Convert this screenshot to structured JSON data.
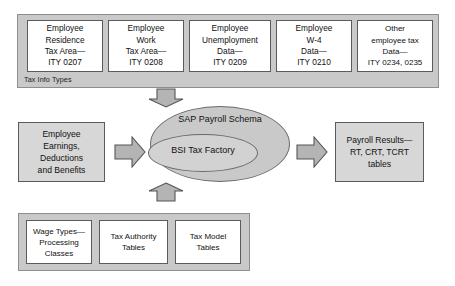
{
  "top_band": {
    "label": "Tax Info Types",
    "boxes": [
      {
        "name": "employee-residence-tax-area",
        "line1": "Employee",
        "line2": "Residence",
        "line3": "Tax Area—",
        "line4": "ITY 0207"
      },
      {
        "name": "employee-work-tax-area",
        "line1": "Employee",
        "line2": "Work",
        "line3": "Tax Area—",
        "line4": "ITY 0208"
      },
      {
        "name": "employee-unemployment-data",
        "line1": "Employee",
        "line2": "Unemployment",
        "line3": "Data—",
        "line4": "ITY 0209"
      },
      {
        "name": "employee-w4-data",
        "line1": "Employee",
        "line2": "W-4",
        "line3": "Data—",
        "line4": "ITY 0210"
      },
      {
        "name": "other-employee-tax-data",
        "line1": "Other",
        "line2": "employee tax",
        "line3": "Data—",
        "line4": "ITY 0234, 0235"
      }
    ]
  },
  "middle": {
    "input_box": {
      "line1": "Employee",
      "line2": "Earnings,",
      "line3": "Deductions",
      "line4": "and Benefits"
    },
    "process": {
      "outer_label": "SAP Payroll Schema",
      "inner_label": "BSI Tax Factory"
    },
    "output_box": {
      "line1": "Payroll Results—",
      "line2": "RT, CRT, TCRT",
      "line3": "tables"
    },
    "arrows": {
      "top_down": "arrow-down",
      "bottom_up": "arrow-up",
      "left_right": "arrow-right",
      "right_right": "arrow-right"
    }
  },
  "bottom_band": {
    "boxes": [
      {
        "name": "wage-types-processing-classes",
        "line1": "Wage Types—",
        "line2": "Processing",
        "line3": "Classes"
      },
      {
        "name": "tax-authority-tables",
        "line1": "Tax Authority",
        "line2": "Tables",
        "line3": ""
      },
      {
        "name": "tax-model-tables",
        "line1": "Tax Model",
        "line2": "Tables",
        "line3": ""
      }
    ]
  },
  "colors": {
    "band_fill": "#c9c9c9",
    "band_border": "#8e8e8e",
    "box_fill": "#ffffff",
    "box_border": "#5b5b5b",
    "side_box_fill": "#d7d7d7",
    "arrow_fill": "#b4b4b4",
    "arrow_border": "#555555",
    "text": "#111111"
  }
}
